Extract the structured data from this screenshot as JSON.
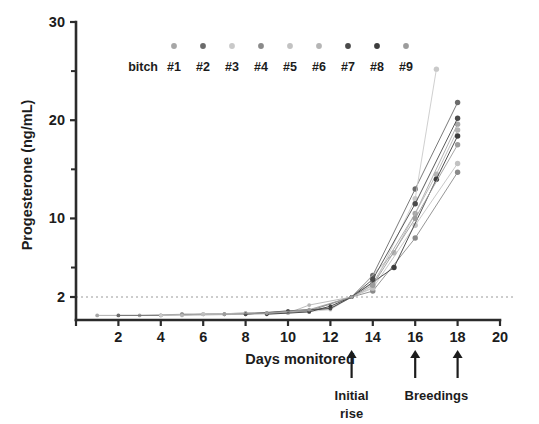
{
  "chart_data": {
    "type": "line",
    "title": "",
    "xlabel": "Days monitored",
    "ylabel": "Progesterone (ng/mL)",
    "xlim": [
      0,
      20
    ],
    "ylim": [
      0,
      30
    ],
    "grid": false,
    "legend_position": "top-inside",
    "legend_title": "bitch",
    "x_ticks": [
      0,
      2,
      4,
      6,
      8,
      10,
      12,
      14,
      16,
      18,
      20
    ],
    "x_tick_labels": [
      "",
      "2",
      "4",
      "6",
      "8",
      "10",
      "12",
      "14",
      "16",
      "18",
      "20"
    ],
    "y_ticks_major": [
      2,
      10,
      20,
      30
    ],
    "y_tick_labels": [
      "2",
      "10",
      "20",
      "30"
    ],
    "y_ticks_minor": [
      5,
      15,
      25
    ],
    "reference_line": {
      "value": 2,
      "style": "dotted",
      "color": "#9a9a9a"
    },
    "annotations": [
      {
        "label": "Initial rise",
        "x": 13,
        "marker": "up-arrow"
      },
      {
        "label": "Breedings",
        "x": 16,
        "marker": "up-arrow"
      },
      {
        "label": "Breedings",
        "x": 18,
        "marker": "up-arrow"
      }
    ],
    "series": [
      {
        "name": "#1",
        "color": "#a6a6a6",
        "x": [
          1,
          3,
          5,
          7,
          9,
          11,
          13,
          14,
          16,
          18
        ],
        "y": [
          0.4,
          0.4,
          0.5,
          0.5,
          0.6,
          0.8,
          2.0,
          3.4,
          10.5,
          19.6
        ]
      },
      {
        "name": "#2",
        "color": "#6b6b6b",
        "x": [
          2,
          4,
          6,
          8,
          10,
          12,
          13,
          14,
          16,
          18
        ],
        "y": [
          0.4,
          0.4,
          0.5,
          0.6,
          0.7,
          1.0,
          2.0,
          4.2,
          13.0,
          21.8
        ]
      },
      {
        "name": "#3",
        "color": "#c9c9c9",
        "x": [
          4,
          6,
          8,
          10,
          12,
          13,
          14,
          16,
          17
        ],
        "y": [
          0.4,
          0.5,
          0.5,
          0.6,
          0.9,
          2.0,
          3.0,
          12.0,
          25.2
        ]
      },
      {
        "name": "#4",
        "color": "#8a8a8a",
        "x": [
          5,
          7,
          9,
          11,
          13,
          14,
          16,
          18
        ],
        "y": [
          0.5,
          0.5,
          0.6,
          0.8,
          2.0,
          2.6,
          8.0,
          14.7
        ]
      },
      {
        "name": "#5",
        "color": "#c2c2c2",
        "x": [
          6,
          8,
          10,
          12,
          13,
          14,
          16,
          18
        ],
        "y": [
          0.5,
          0.6,
          0.7,
          1.1,
          2.0,
          2.9,
          9.3,
          15.6
        ]
      },
      {
        "name": "#6",
        "color": "#b5b5b5",
        "x": [
          5,
          8,
          10,
          11,
          13,
          15,
          17,
          18
        ],
        "y": [
          0.4,
          0.5,
          0.6,
          1.3,
          2.0,
          6.5,
          14.5,
          19.0
        ]
      },
      {
        "name": "#7",
        "color": "#4a4a4a",
        "x": [
          8,
          10,
          12,
          13,
          14,
          16,
          18
        ],
        "y": [
          0.5,
          0.8,
          1.0,
          2.0,
          3.8,
          11.5,
          20.2
        ]
      },
      {
        "name": "#8",
        "color": "#3d3d3d",
        "x": [
          9,
          11,
          12,
          13,
          15,
          17,
          18
        ],
        "y": [
          0.5,
          0.7,
          1.2,
          2.0,
          5.0,
          14.0,
          18.4
        ]
      },
      {
        "name": "#9",
        "color": "#9c9c9c",
        "x": [
          7,
          9,
          11,
          13,
          14,
          16,
          18
        ],
        "y": [
          0.5,
          0.6,
          0.9,
          2.0,
          3.2,
          10.0,
          17.5
        ]
      }
    ]
  },
  "legend": {
    "title": "bitch",
    "entries": [
      {
        "label": "#1",
        "color": "#a6a6a6"
      },
      {
        "label": "#2",
        "color": "#6b6b6b"
      },
      {
        "label": "#3",
        "color": "#c9c9c9"
      },
      {
        "label": "#4",
        "color": "#8a8a8a"
      },
      {
        "label": "#5",
        "color": "#c2c2c2"
      },
      {
        "label": "#6",
        "color": "#b5b5b5"
      },
      {
        "label": "#7",
        "color": "#4a4a4a"
      },
      {
        "label": "#8",
        "color": "#3d3d3d"
      },
      {
        "label": "#9",
        "color": "#9c9c9c"
      }
    ]
  },
  "annotations_text": {
    "initial_rise_line1": "Initial",
    "initial_rise_line2": "rise",
    "breedings": "Breedings"
  }
}
